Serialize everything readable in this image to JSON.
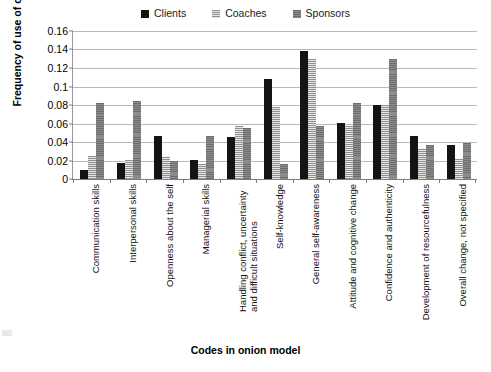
{
  "chart_data": {
    "type": "bar",
    "title": "",
    "xlabel": "Codes in onion model",
    "ylabel": "Frequency of use of codes",
    "ylim": [
      0,
      0.16
    ],
    "ytick_labels": [
      "0.16",
      "0.14",
      "0.12",
      "0.1",
      "0.08",
      "0.06",
      "0.04",
      "0.02",
      "0"
    ],
    "ytick_values": [
      0.16,
      0.14,
      0.12,
      0.1,
      0.08,
      0.06,
      0.04,
      0.02,
      0
    ],
    "grid": true,
    "legend_position": "top-center",
    "categories": [
      "Communication skills",
      "Interpersonal skills",
      "Openness about the self",
      "Managerial skills",
      "Handling conflict, uncertainty and difficult situations",
      "Self-knowledge",
      "General self-awareness",
      "Attitude and cognitive change",
      "Confidence and authenticity",
      "Development of resourcefulness",
      "Overall change, not specified"
    ],
    "series": [
      {
        "name": "Clients",
        "color": "#141414",
        "values": [
          0.01,
          0.017,
          0.046,
          0.02,
          0.045,
          0.108,
          0.138,
          0.061,
          0.08,
          0.047,
          0.037
        ]
      },
      {
        "name": "Coaches",
        "color": "#cfcfcf",
        "values": [
          0.025,
          0.02,
          0.024,
          0.016,
          0.057,
          0.078,
          0.13,
          0.057,
          0.08,
          0.032,
          0.022
        ]
      },
      {
        "name": "Sponsors",
        "color": "#7b7b7b",
        "values": [
          0.082,
          0.084,
          0.019,
          0.046,
          0.055,
          0.016,
          0.057,
          0.082,
          0.13,
          0.037,
          0.039
        ]
      }
    ]
  },
  "legend": {
    "entries": [
      {
        "label": "Clients",
        "swatch": "fill-clients"
      },
      {
        "label": "Coaches",
        "swatch": "fill-coaches"
      },
      {
        "label": "Sponsors",
        "swatch": "fill-sponsors"
      }
    ]
  },
  "axes": {
    "y_title": "Frequency of use of codes",
    "x_title": "Codes in onion model"
  }
}
